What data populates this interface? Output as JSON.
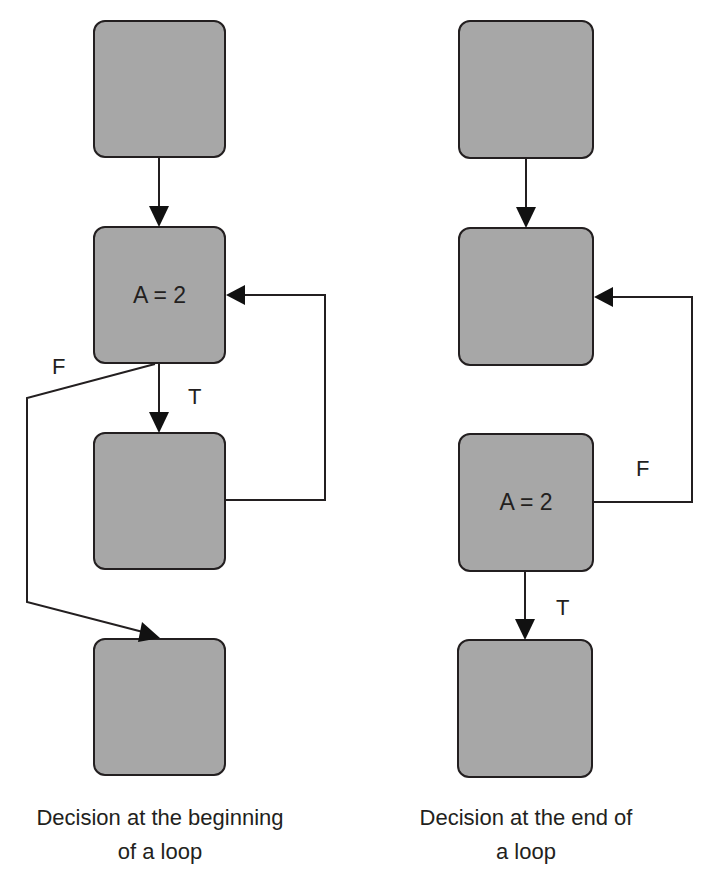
{
  "colors": {
    "box_fill": "#a7a7a7",
    "stroke": "#231f20",
    "background": "#ffffff"
  },
  "left_diagram": {
    "caption_line1": "Decision at the beginning",
    "caption_line2": "of a loop",
    "boxes": [
      {
        "id": "L1",
        "text": ""
      },
      {
        "id": "L2",
        "text": "A = 2"
      },
      {
        "id": "L3",
        "text": ""
      },
      {
        "id": "L4",
        "text": ""
      }
    ],
    "edge_labels": {
      "false": "F",
      "true": "T"
    },
    "edges": [
      {
        "from": "L1",
        "to": "L2",
        "label": ""
      },
      {
        "from": "L2",
        "to": "L3",
        "label": "T"
      },
      {
        "from": "L2",
        "to": "L4",
        "label": "F"
      },
      {
        "from": "L3",
        "to": "L2",
        "label": ""
      }
    ]
  },
  "right_diagram": {
    "caption_line1": "Decision at the end of",
    "caption_line2": "a loop",
    "boxes": [
      {
        "id": "R1",
        "text": ""
      },
      {
        "id": "R2",
        "text": ""
      },
      {
        "id": "R3",
        "text": "A = 2"
      },
      {
        "id": "R4",
        "text": ""
      }
    ],
    "edge_labels": {
      "false": "F",
      "true": "T"
    },
    "edges": [
      {
        "from": "R1",
        "to": "R2",
        "label": ""
      },
      {
        "from": "R3",
        "to": "R2",
        "label": "F"
      },
      {
        "from": "R3",
        "to": "R4",
        "label": "T"
      }
    ]
  }
}
